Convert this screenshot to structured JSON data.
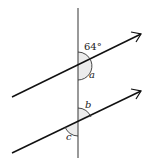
{
  "diagram": {
    "labels": {
      "given_angle": "64°",
      "angle_a": "a",
      "angle_b": "b",
      "angle_c": "c"
    },
    "colors": {
      "line": "#111111",
      "transversal": "#555555",
      "arc": "#333333",
      "shade": "#e6e6e6"
    }
  }
}
